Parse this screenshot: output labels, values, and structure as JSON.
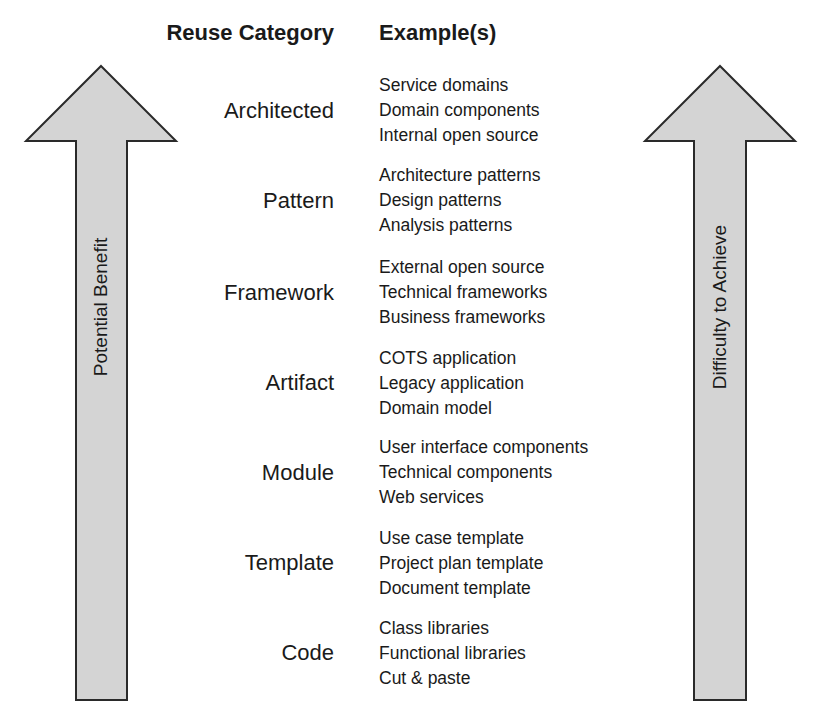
{
  "headers": {
    "category": "Reuse Category",
    "examples": "Example(s)"
  },
  "arrows": {
    "left_label": "Potential Benefit",
    "right_label": "Difficulty to Achieve",
    "fill_color": "#d4d4d4",
    "stroke_color": "#2a2a2a"
  },
  "categories": [
    {
      "name": "Architected",
      "examples": [
        "Service domains",
        "Domain components",
        "Internal open source"
      ]
    },
    {
      "name": "Pattern",
      "examples": [
        "Architecture patterns",
        "Design patterns",
        "Analysis patterns"
      ]
    },
    {
      "name": "Framework",
      "examples": [
        "External open source",
        "Technical frameworks",
        "Business frameworks"
      ]
    },
    {
      "name": "Artifact",
      "examples": [
        "COTS application",
        "Legacy application",
        "Domain model"
      ]
    },
    {
      "name": "Module",
      "examples": [
        "User interface components",
        "Technical components",
        "Web services"
      ]
    },
    {
      "name": "Template",
      "examples": [
        "Use case template",
        "Project plan template",
        "Document template"
      ]
    },
    {
      "name": "Code",
      "examples": [
        "Class libraries",
        "Functional libraries",
        "Cut & paste"
      ]
    }
  ]
}
